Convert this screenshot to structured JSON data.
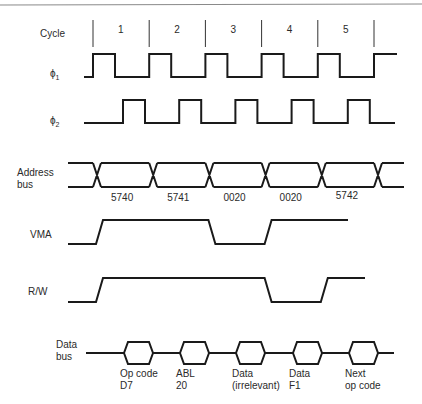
{
  "diagram": {
    "title": "",
    "row_labels": {
      "cycle": "Cycle",
      "phi1": "ϕ",
      "phi1_sub": "1",
      "phi2": "ϕ",
      "phi2_sub": "2",
      "address_line1": "Address",
      "address_line2": "bus",
      "vma": "VMA",
      "rw": "R/W",
      "data_line1": "Data",
      "data_line2": "bus"
    },
    "cycles": [
      "1",
      "2",
      "3",
      "4",
      "5"
    ],
    "address_values": [
      "5740",
      "5741",
      "0020",
      "0020",
      "5742"
    ],
    "vma_levels": [
      1,
      1,
      0,
      1,
      1
    ],
    "rw_levels": [
      1,
      1,
      1,
      0,
      1
    ],
    "data_bus": [
      {
        "line1": "Op code",
        "line2": "D7"
      },
      {
        "line1": "ABL",
        "line2": "20"
      },
      {
        "line1": "Data",
        "line2": "(irrelevant)"
      },
      {
        "line1": "Data",
        "line2": "F1"
      },
      {
        "line1": "Next",
        "line2": "op code"
      }
    ]
  }
}
